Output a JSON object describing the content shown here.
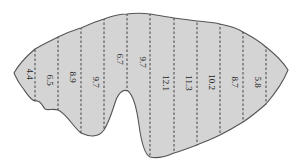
{
  "figure": {
    "fill_color": "#d4d4d4",
    "outline_color": "#555555",
    "divider_color": "#333333",
    "strip_labels": [
      "4.4",
      "6.5",
      "8.9",
      "9.7",
      "6.7",
      "9.7",
      "12.1",
      "11.3",
      "10.2",
      "8.7",
      "5.8"
    ],
    "divider_x": [
      35,
      58,
      81,
      104,
      127,
      150,
      174,
      197,
      220,
      243,
      266
    ],
    "label_x": [
      27,
      47,
      70,
      93,
      117,
      140,
      163,
      186,
      209,
      232,
      255
    ],
    "label_y": [
      74,
      80,
      77,
      82,
      59,
      62,
      83,
      83,
      82,
      82,
      82
    ]
  }
}
